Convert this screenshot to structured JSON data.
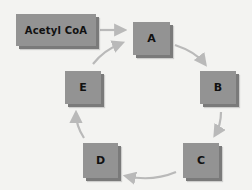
{
  "diagram": {
    "title": "",
    "colors": {
      "background": "#f3f3f1",
      "node_fill": "#939393",
      "node_shadow": "#7a7a7a",
      "arrow": "#b9b9b9",
      "text": "#111111"
    },
    "start_node": {
      "id": "acetyl-coa",
      "label": "Acetyl CoA"
    },
    "nodes": [
      {
        "id": "A",
        "label": "A"
      },
      {
        "id": "B",
        "label": "B"
      },
      {
        "id": "C",
        "label": "C"
      },
      {
        "id": "D",
        "label": "D"
      },
      {
        "id": "E",
        "label": "E"
      }
    ],
    "edges": [
      {
        "from": "Acetyl CoA",
        "to": "A"
      },
      {
        "from": "A",
        "to": "B"
      },
      {
        "from": "B",
        "to": "C"
      },
      {
        "from": "C",
        "to": "D"
      },
      {
        "from": "D",
        "to": "E"
      },
      {
        "from": "E",
        "to": "A"
      }
    ],
    "layout": "cycle"
  }
}
